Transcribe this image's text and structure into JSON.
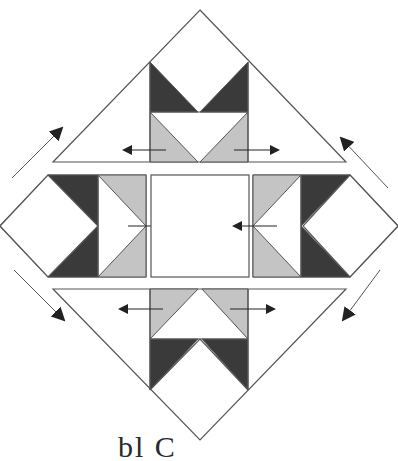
{
  "diagram": {
    "colors": {
      "dark": "#3a3a3a",
      "light": "#c4c4c4",
      "white": "#ffffff",
      "outline": "#555555",
      "arrow": "#222222"
    },
    "units": [
      {
        "name": "top-setting-triangle",
        "description": "Top triangle unit with two flying-geese (dark and light)"
      },
      {
        "name": "left-unit",
        "description": "Left half-diamond with dark and light triangles"
      },
      {
        "name": "center-square",
        "description": "Plain center square"
      },
      {
        "name": "right-unit",
        "description": "Right half-diamond with dark and light triangles"
      },
      {
        "name": "bottom-setting-triangle",
        "description": "Bottom triangle unit with two flying-geese (light and dark)"
      }
    ],
    "arrows": {
      "pressing_directions": [
        "left",
        "right",
        "right",
        "left",
        "left",
        "right"
      ],
      "sewing_directions": [
        "up-right",
        "up-left",
        "down-right",
        "down-left"
      ]
    }
  },
  "caption": {
    "text": "bl  C"
  }
}
